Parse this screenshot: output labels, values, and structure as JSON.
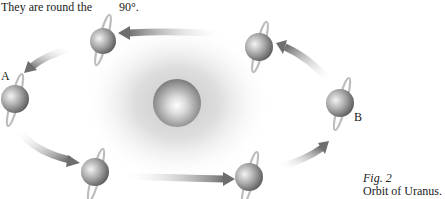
{
  "header_text": {
    "left": "They are round the",
    "right": "90°."
  },
  "labels": {
    "A": "A",
    "B": "B"
  },
  "caption": {
    "figure": "Fig. 2",
    "title": "Orbit of Uranus."
  },
  "diagram": {
    "central_body": "sun",
    "orbiting_body": "Uranus",
    "positions": [
      {
        "id": "top-left",
        "x": 103,
        "y": 42
      },
      {
        "id": "top-right",
        "x": 260,
        "y": 47
      },
      {
        "id": "left-A",
        "x": 15,
        "y": 99
      },
      {
        "id": "right-B",
        "x": 340,
        "y": 103
      },
      {
        "id": "bottom-left",
        "x": 95,
        "y": 172
      },
      {
        "id": "bottom-right",
        "x": 249,
        "y": 177
      }
    ],
    "direction": "counter-clockwise"
  }
}
